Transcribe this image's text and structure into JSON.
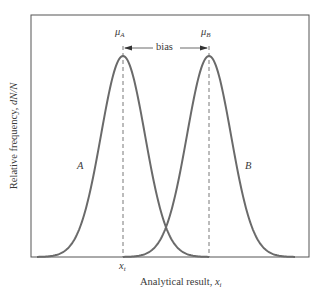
{
  "diagram": {
    "xlabel": "Analytical result, ",
    "xlabel_var": "x",
    "xlabel_sub": "i",
    "ylabel_prefix": "Relative frequency, ",
    "ylabel_var": "dN/N",
    "mu_a_symbol": "μ",
    "mu_a_sub": "A",
    "mu_b_symbol": "μ",
    "mu_b_sub": "B",
    "bias_label": "bias",
    "curve_a_label": "A",
    "curve_b_label": "B",
    "xt_var": "x",
    "xt_sub": "t",
    "colors": {
      "curve": "#6a6a6a",
      "frame": "#555555",
      "text": "#3a3a3a"
    }
  },
  "chart_data": {
    "type": "line",
    "title": "",
    "xlabel": "Analytical result, x_i",
    "ylabel": "Relative frequency, dN/N",
    "series": [
      {
        "name": "A",
        "distribution": "gaussian",
        "mean_label": "μ_A",
        "mean_at": "x_t"
      },
      {
        "name": "B",
        "distribution": "gaussian",
        "mean_label": "μ_B"
      }
    ],
    "annotations": [
      {
        "text": "bias",
        "from": "μ_A",
        "to": "μ_B",
        "type": "double-arrow"
      },
      {
        "text": "x_t",
        "position": "x-axis under μ_A"
      }
    ],
    "grid": false,
    "legend": "none (inline labels A, B)"
  }
}
